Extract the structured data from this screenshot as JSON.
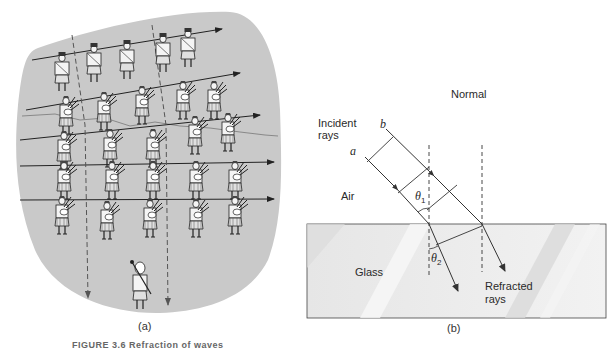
{
  "figure": {
    "caption": "FIGURE 3.6 Refraction of waves",
    "colors": {
      "blob_fill": "#c9c9c9",
      "line": "#3a3a3a",
      "glass_fill": "#ececec",
      "glass_stripe": "#dcdcdc"
    }
  },
  "panel_a": {
    "label": "(a)",
    "description": "Marching band of pipers; rows turn as they cross a boundary",
    "rows": 5,
    "columns": 5,
    "leader": "drum-major"
  },
  "panel_b": {
    "label": "(b)",
    "labels": {
      "incident_line1": "Incident",
      "incident_line2": "rays",
      "ray_a": "a",
      "ray_b": "b",
      "normal": "Normal",
      "air": "Air",
      "glass": "Glass",
      "theta1": "θ",
      "theta1_sub": "1",
      "theta2": "θ",
      "theta2_sub": "2",
      "refracted_line1": "Refracted",
      "refracted_line2": "rays"
    }
  }
}
